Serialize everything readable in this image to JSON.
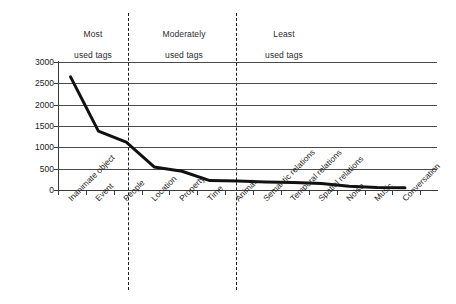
{
  "chart_data": {
    "type": "line",
    "title": "",
    "subtitle": "",
    "xlabel": "",
    "ylabel": "",
    "ylim": [
      0,
      3000
    ],
    "grid": true,
    "legend": "none",
    "categories": [
      "Inanimate object",
      "Event",
      "People",
      "Location",
      "Property",
      "Time",
      "Animal",
      "Semantic relations",
      "Temporal relations",
      "Spatial relations",
      "Noise",
      "Music",
      "Conversation"
    ],
    "values": [
      2650,
      1380,
      1120,
      540,
      440,
      220,
      210,
      190,
      175,
      150,
      90,
      60,
      50
    ],
    "yticks": [
      0,
      500,
      1000,
      1500,
      2000,
      2500,
      3000
    ],
    "ytick_labels": [
      "0",
      "500",
      "1000",
      "1500",
      "2000",
      "2500",
      "3000"
    ],
    "annotations": [
      {
        "text": "Most\nused tags",
        "covers": [
          "Inanimate object",
          "Event",
          "People"
        ]
      },
      {
        "text": "Moderately\nused tags",
        "covers": [
          "Location",
          "Property",
          "Time",
          "Animal"
        ]
      },
      {
        "text": "Least\nused tags",
        "covers": [
          "Semantic relations",
          "Temporal relations",
          "Spatial relations",
          "Noise",
          "Music",
          "Conversation"
        ]
      }
    ],
    "dividers": [
      3,
      7
    ],
    "line_color": "#111111",
    "grid_color": "#4a4a4a",
    "axis_color": "#3a3a3a"
  },
  "sections": [
    {
      "line1": "Most",
      "line2": "used tags"
    },
    {
      "line1": "Moderately",
      "line2": "used tags"
    },
    {
      "line1": "Least",
      "line2": "used tags"
    }
  ]
}
